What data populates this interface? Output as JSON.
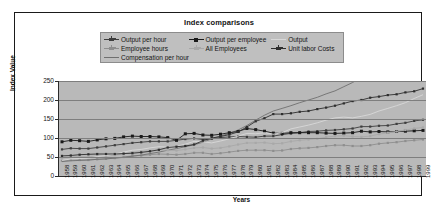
{
  "chart": {
    "title": "Index comparisons",
    "xlabel": "Years",
    "ylabel": "Index Value"
  },
  "legend": {
    "items": [
      {
        "label": "Output per hour",
        "color": "#3d3d3d",
        "marker": "plus",
        "column": 1
      },
      {
        "label": "Employee hours",
        "color": "#8e8e8e",
        "marker": "plus",
        "column": 1
      },
      {
        "label": "Compensation per hour",
        "color": "#6f6f6f",
        "marker": "line",
        "column": 1
      },
      {
        "label": "Output per employee",
        "color": "#1a1a1a",
        "marker": "square",
        "column": 2
      },
      {
        "label": "All Employees",
        "color": "#a8a8a8",
        "marker": "plus",
        "column": 2
      },
      {
        "label": "Output",
        "color": "#d8d8d8",
        "marker": "line",
        "column": 3
      },
      {
        "label": "Unit labor Costs",
        "color": "#2e2e2e",
        "marker": "plus",
        "column": 3
      }
    ]
  },
  "chart_data": {
    "type": "line",
    "title": "Index comparisons",
    "xlabel": "Years",
    "ylabel": "Index Value",
    "ylim": [
      0,
      250
    ],
    "yticks": [
      0,
      50,
      100,
      150,
      200,
      250
    ],
    "grid": true,
    "legend_position": "top",
    "x": [
      1958,
      1959,
      1960,
      1961,
      1962,
      1963,
      1964,
      1965,
      1966,
      1967,
      1968,
      1969,
      1970,
      1971,
      1972,
      1973,
      1974,
      1975,
      1976,
      1977,
      1978,
      1979,
      1980,
      1981,
      1982,
      1983,
      1984,
      1985,
      1986,
      1987,
      1988,
      1989,
      1990,
      1991,
      1992,
      1993,
      1994,
      1995,
      1996,
      1997,
      1998,
      1999
    ],
    "series": [
      {
        "name": "Output per hour",
        "color": "#3d3d3d",
        "values": [
          70,
          73,
          72,
          72,
          75,
          78,
          81,
          84,
          87,
          89,
          91,
          91,
          91,
          94,
          97,
          99,
          96,
          98,
          101,
          103,
          104,
          103,
          102,
          105,
          105,
          109,
          112,
          114,
          117,
          118,
          120,
          121,
          123,
          125,
          130,
          130,
          132,
          133,
          137,
          140,
          145,
          148
        ]
      },
      {
        "name": "Employee hours",
        "color": "#8e8e8e",
        "values": [
          40,
          42,
          42,
          42,
          44,
          45,
          47,
          50,
          53,
          54,
          56,
          58,
          57,
          56,
          58,
          61,
          61,
          58,
          60,
          63,
          66,
          68,
          68,
          68,
          66,
          67,
          71,
          73,
          74,
          76,
          79,
          81,
          81,
          79,
          79,
          81,
          85,
          87,
          89,
          92,
          94,
          96
        ]
      },
      {
        "name": "Compensation per hour",
        "color": "#6f6f6f",
        "values": [
          38,
          40,
          41,
          42,
          44,
          45,
          47,
          49,
          52,
          55,
          59,
          63,
          68,
          72,
          77,
          82,
          89,
          98,
          105,
          112,
          121,
          133,
          147,
          160,
          171,
          178,
          185,
          193,
          200,
          207,
          216,
          224,
          235,
          246,
          260,
          268,
          276,
          284,
          295,
          308,
          324,
          340
        ]
      },
      {
        "name": "Output per employee",
        "color": "#1a1a1a",
        "values": [
          90,
          94,
          93,
          91,
          95,
          98,
          99,
          103,
          105,
          104,
          104,
          103,
          101,
          94,
          111,
          112,
          108,
          107,
          110,
          114,
          117,
          125,
          122,
          118,
          113,
          112,
          114,
          114,
          114,
          114,
          113,
          112,
          113,
          114,
          118,
          116,
          117,
          116,
          117,
          118,
          119,
          120
        ]
      },
      {
        "name": "All Employees",
        "color": "#a8a8a8",
        "values": [
          48,
          50,
          51,
          50,
          52,
          53,
          55,
          58,
          62,
          64,
          66,
          69,
          68,
          67,
          70,
          74,
          75,
          72,
          74,
          78,
          83,
          87,
          87,
          88,
          85,
          86,
          91,
          94,
          96,
          98,
          102,
          105,
          106,
          104,
          103,
          105,
          110,
          114,
          117,
          121,
          125,
          128
        ]
      },
      {
        "name": "Output",
        "color": "#d8d8d8",
        "values": [
          41,
          45,
          46,
          47,
          51,
          54,
          58,
          63,
          68,
          70,
          74,
          77,
          76,
          78,
          84,
          91,
          90,
          87,
          92,
          98,
          105,
          112,
          111,
          114,
          110,
          114,
          124,
          129,
          134,
          140,
          147,
          153,
          155,
          153,
          157,
          162,
          171,
          178,
          185,
          193,
          204,
          214
        ]
      },
      {
        "name": "Unit labor Costs",
        "color": "#2e2e2e",
        "values": [
          53,
          54,
          56,
          57,
          58,
          58,
          58,
          59,
          60,
          62,
          65,
          69,
          75,
          77,
          79,
          83,
          93,
          100,
          104,
          109,
          116,
          129,
          144,
          152,
          163,
          163,
          165,
          169,
          171,
          176,
          180,
          185,
          191,
          197,
          200,
          206,
          209,
          213,
          215,
          220,
          223,
          230
        ]
      }
    ]
  },
  "xticks": [
    "1958",
    "1959",
    "1960",
    "1961",
    "1962",
    "1963",
    "1964",
    "1965",
    "1966",
    "1967",
    "1968",
    "1969",
    "1970",
    "1971",
    "1972",
    "1973",
    "1974",
    "1975",
    "1976",
    "1977",
    "1978",
    "1979",
    "1980",
    "1981",
    "1982",
    "1983",
    "1984",
    "1985",
    "1986",
    "1987",
    "1988",
    "1989",
    "1990",
    "1991",
    "1992",
    "1993",
    "1994",
    "1995",
    "1996",
    "1997",
    "1998",
    "1999"
  ]
}
